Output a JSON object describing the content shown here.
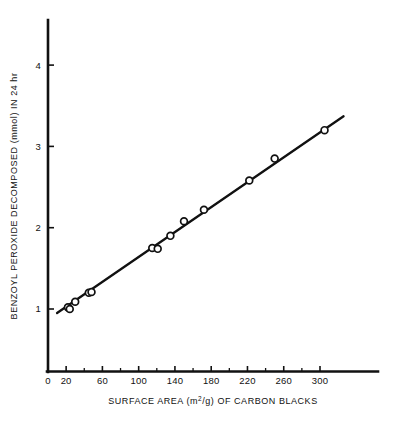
{
  "chart_data": {
    "type": "scatter",
    "title": "",
    "xlabel": "SURFACE AREA (m2/g) OF CARBON BLACKS",
    "xlabel_parts": {
      "before": "SURFACE AREA (m",
      "superscript": "2",
      "after": "/g) OF CARBON BLACKS"
    },
    "ylabel": "BENZOYL PEROXIDE DECOMPOSED (mmol) IN 24 hr",
    "xlim": [
      0,
      330
    ],
    "ylim": [
      0,
      4.3
    ],
    "xticks": [
      0,
      20,
      60,
      100,
      140,
      180,
      220,
      260,
      300
    ],
    "xtick_labels": [
      "0",
      "20",
      "60",
      "100",
      "140",
      "180",
      "220",
      "260",
      "300"
    ],
    "x_minor_ticks": [
      40,
      80,
      120,
      160,
      200,
      240,
      280
    ],
    "yticks": [
      1,
      2,
      3,
      4
    ],
    "ytick_labels": [
      "1",
      "2",
      "3",
      "4"
    ],
    "grid": false,
    "legend": null,
    "marker": "open-circle",
    "series": [
      {
        "name": "Benzoyl peroxide decomposed vs surface area",
        "x": [
          22,
          24,
          30,
          45,
          48,
          115,
          121,
          135,
          150,
          172,
          222,
          250,
          305
        ],
        "y": [
          1.02,
          1.0,
          1.09,
          1.2,
          1.21,
          1.75,
          1.74,
          1.9,
          2.08,
          2.22,
          2.58,
          2.85,
          3.2
        ]
      }
    ],
    "fit_line": {
      "type": "linear",
      "x_start": 10,
      "y_start": 0.95,
      "x_end": 326,
      "y_end": 3.37,
      "slope": 0.00766,
      "intercept": 0.873
    },
    "colors": {
      "axis": "#111111",
      "line": "#111111",
      "marker_stroke": "#111111",
      "marker_fill": "#ffffff",
      "background": "#ffffff"
    }
  }
}
